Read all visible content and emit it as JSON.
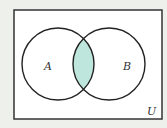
{
  "diagram": {
    "type": "venn",
    "universe_label": "U",
    "sets": [
      {
        "label": "A",
        "cx": 58,
        "cy": 64,
        "r": 36
      },
      {
        "label": "B",
        "cx": 109,
        "cy": 64,
        "r": 36
      }
    ],
    "shaded_region": "A ∩ B",
    "colors": {
      "background": "#eef0ec",
      "universe_fill": "#ffffff",
      "stroke": "#222222",
      "shade": "#bfe6dc"
    }
  }
}
